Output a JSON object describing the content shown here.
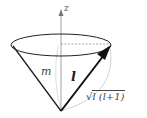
{
  "diagram": {
    "labels": {
      "axis": "z",
      "projection": "m",
      "vector": "l",
      "magnitude_radical": "√",
      "magnitude_inner": "l (l+1)"
    },
    "colors": {
      "stroke": "#222222",
      "axis": "#888888",
      "faint": "#bbbbbb",
      "background": "#ffffff"
    }
  }
}
